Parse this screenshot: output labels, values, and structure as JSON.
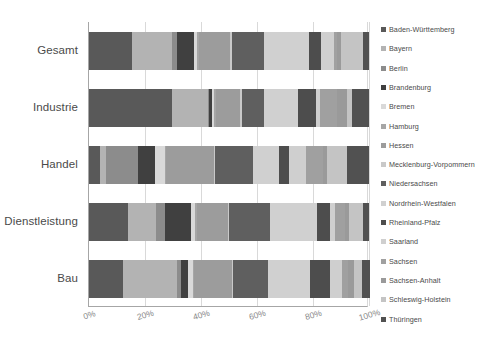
{
  "chart_data": {
    "type": "bar",
    "orientation": "horizontal",
    "stacked": true,
    "stacked_mode": "percent",
    "title": "",
    "xlabel": "",
    "ylabel": "",
    "xlim": [
      0,
      100
    ],
    "grid": true,
    "legend_position": "right",
    "xticklabels": [
      "0%",
      "20%",
      "40%",
      "60%",
      "80%",
      "100%"
    ],
    "xtickvalues": [
      0,
      20,
      40,
      60,
      80,
      100
    ],
    "categories": [
      "Gesamt",
      "Industrie",
      "Handel",
      "Dienstleistung",
      "Bau"
    ],
    "series": [
      {
        "name": "Baden-Württemberg",
        "color": "#595959",
        "values": [
          15.5,
          29.5,
          4.0,
          14.0,
          12.0
        ]
      },
      {
        "name": "Bayern",
        "color": "#b3b3b3",
        "values": [
          14.0,
          13.0,
          2.0,
          10.0,
          19.5
        ]
      },
      {
        "name": "Berlin",
        "color": "#8c8c8c",
        "values": [
          2.0,
          0.5,
          11.5,
          3.0,
          1.5
        ]
      },
      {
        "name": "Brandenburg",
        "color": "#404040",
        "values": [
          6.0,
          0.8,
          6.0,
          9.5,
          2.5
        ]
      },
      {
        "name": "Bremen",
        "color": "#d9d9d9",
        "values": [
          1.0,
          1.0,
          3.5,
          1.5,
          1.5
        ]
      },
      {
        "name": "Hamburg",
        "color": "#a6a6a6",
        "values": [
          0.8,
          0.5,
          0.5,
          0.5,
          0.5
        ]
      },
      {
        "name": "Hessen",
        "color": "#9c9c9c",
        "values": [
          11.0,
          8.5,
          17.0,
          11.0,
          13.5
        ]
      },
      {
        "name": "Mecklenburg-Vorpommern",
        "color": "#c9c9c9",
        "values": [
          0.7,
          0.7,
          0.5,
          0.5,
          0.5
        ]
      },
      {
        "name": "Niedersachsen",
        "color": "#5f5f5f",
        "values": [
          11.5,
          8.0,
          13.5,
          14.5,
          12.5
        ]
      },
      {
        "name": "Nordrhein-Westfalen",
        "color": "#d0d0d0",
        "values": [
          16.0,
          12.0,
          9.5,
          17.0,
          15.0
        ]
      },
      {
        "name": "Rheinland-Pfalz",
        "color": "#4d4d4d",
        "values": [
          4.5,
          6.5,
          3.5,
          4.5,
          7.0
        ]
      },
      {
        "name": "Saarland",
        "color": "#cfcfcf",
        "values": [
          4.5,
          1.5,
          6.0,
          2.0,
          4.5
        ]
      },
      {
        "name": "Sachsen",
        "color": "#a0a0a0",
        "values": [
          1.0,
          6.0,
          6.0,
          3.5,
          2.0
        ]
      },
      {
        "name": "Sachsen-Anhalt",
        "color": "#9a9a9a",
        "values": [
          1.5,
          3.5,
          1.5,
          1.5,
          2.0
        ]
      },
      {
        "name": "Schleswig-Holstein",
        "color": "#c4c4c4",
        "values": [
          8.0,
          2.0,
          7.0,
          5.0,
          3.0
        ]
      },
      {
        "name": "Thüringen",
        "color": "#515151",
        "values": [
          2.0,
          6.0,
          8.0,
          2.0,
          3.0
        ]
      }
    ]
  },
  "legend": {
    "items": [
      "Baden-Württemberg",
      "Bayern",
      "Berlin",
      "Brandenburg",
      "Bremen",
      "Hamburg",
      "Hessen",
      "Mecklenburg-Vorpommern",
      "Niedersachsen",
      "Nordrhein-Westfalen",
      "Rheinland-Pfalz",
      "Saarland",
      "Sachsen",
      "Sachsen-Anhalt",
      "Schleswig-Holstein",
      "Thüringen"
    ]
  }
}
